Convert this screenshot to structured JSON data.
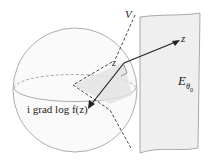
{
  "diagram": {
    "labels": {
      "V": "V",
      "z_outer": "z",
      "z_inner": "z",
      "E": "E",
      "E_sub": "θ",
      "E_subsub": "0",
      "grad": "i grad log f(z)"
    },
    "colors": {
      "stroke": "#333333",
      "sphere_stroke": "#999999",
      "plane_fill": "#efefef",
      "shade_fill": "#e2e2e2"
    }
  }
}
